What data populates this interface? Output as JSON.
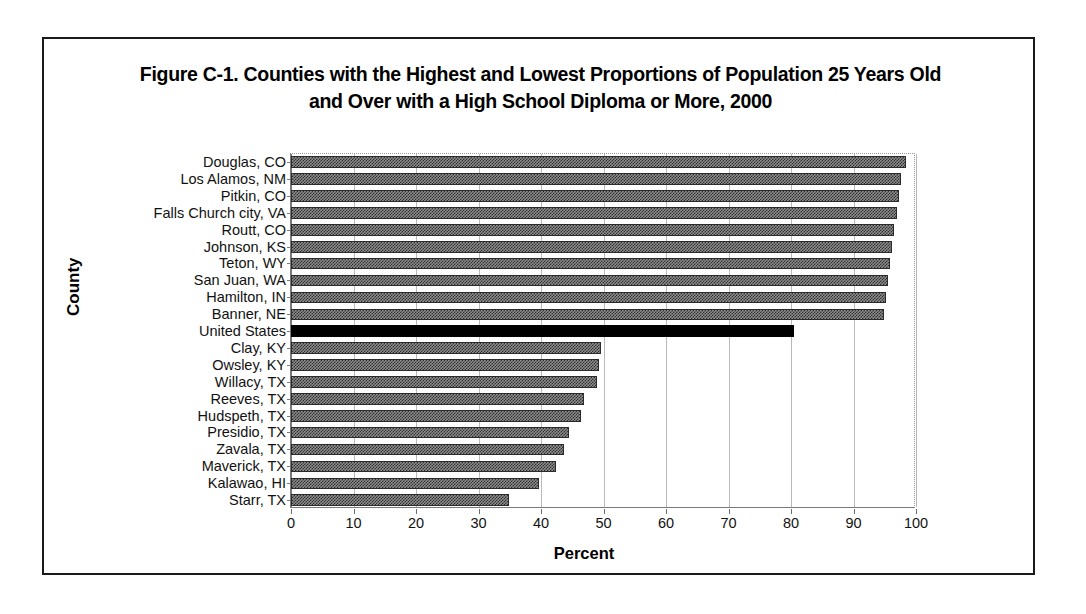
{
  "figure": {
    "title_line1": "Figure C-1. Counties with the Highest and Lowest Proportions of Population 25 Years Old",
    "title_line2": "and Over with a High School Diploma or More, 2000",
    "y_axis_title": "County",
    "x_axis_title": "Percent"
  },
  "chart_data": {
    "type": "bar",
    "orientation": "horizontal",
    "title": "Figure C-1. Counties with the Highest and Lowest Proportions of Population 25 Years Old and Over with a High School Diploma or More, 2000",
    "xlabel": "Percent",
    "ylabel": "County",
    "xlim": [
      0,
      100
    ],
    "xticks": [
      0,
      10,
      20,
      30,
      40,
      50,
      60,
      70,
      80,
      90,
      100
    ],
    "xtick_labels": [
      "0",
      "10",
      "20",
      "30",
      "40",
      "50",
      "60",
      "70",
      "80",
      "90",
      "100"
    ],
    "grid": "vertical",
    "legend": "none",
    "categories": [
      "Douglas, CO",
      "Los Alamos, NM",
      "Pitkin, CO",
      "Falls Church city, VA",
      "Routt, CO",
      "Johnson, KS",
      "Teton, WY",
      "San Juan, WA",
      "Hamilton, IN",
      "Banner, NE",
      "United States",
      "Clay, KY",
      "Owsley, KY",
      "Willacy, TX",
      "Reeves, TX",
      "Hudspeth, TX",
      "Presidio, TX",
      "Zavala, TX",
      "Maverick, TX",
      "Kalawao, HI",
      "Starr, TX"
    ],
    "values": [
      98.4,
      97.6,
      97.2,
      97.0,
      96.5,
      96.2,
      95.8,
      95.5,
      95.2,
      94.9,
      80.4,
      49.6,
      49.3,
      48.9,
      46.9,
      46.4,
      44.5,
      43.6,
      42.4,
      39.6,
      34.8
    ],
    "highlight_category": "United States",
    "highlight_color": "#000000",
    "bar_fill_color": "#8e8e8e",
    "bar_edge_color": "#2b2b2b"
  }
}
